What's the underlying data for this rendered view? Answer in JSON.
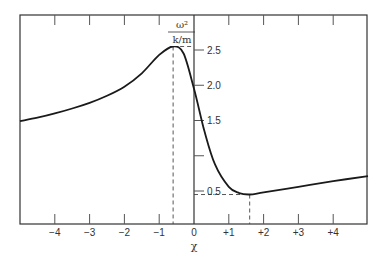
{
  "chart_data": {
    "type": "line",
    "title": "",
    "xlabel": "χ",
    "ylabel": "ω² / (k/m)",
    "ylabel_numerator": "ω²",
    "ylabel_denominator": "k/m",
    "xlim": [
      -5,
      5
    ],
    "ylim": [
      0.25,
      3.0
    ],
    "x_ticks": [
      -4,
      -3,
      -2,
      -1,
      0,
      1,
      2,
      3,
      4
    ],
    "x_tick_labels": [
      "−4",
      "−3",
      "−2",
      "−1",
      "0",
      "+1",
      "+2",
      "+3",
      "+4"
    ],
    "y_ticks": [
      0.5,
      1.0,
      1.5,
      2.0,
      2.5
    ],
    "y_tick_labels": [
      "0.5",
      "",
      "1.5",
      "2.0",
      "2.5"
    ],
    "grid": false,
    "legend": null,
    "series": [
      {
        "name": "ω²/(k/m) vs χ",
        "x": [
          -5.0,
          -4.5,
          -4.0,
          -3.5,
          -3.0,
          -2.5,
          -2.0,
          -1.5,
          -1.0,
          -0.6,
          -0.3,
          0.0,
          0.3,
          0.6,
          1.0,
          1.3,
          1.6,
          2.0,
          3.0,
          4.0,
          5.0
        ],
        "y": [
          1.49,
          1.54,
          1.6,
          1.67,
          1.75,
          1.85,
          1.98,
          2.17,
          2.43,
          2.55,
          2.45,
          1.95,
          1.35,
          0.88,
          0.56,
          0.47,
          0.45,
          0.48,
          0.56,
          0.64,
          0.71
        ]
      }
    ],
    "annotations": [
      {
        "type": "dashed-guide",
        "description": "peak",
        "x": -0.6,
        "y": 2.55
      },
      {
        "type": "dashed-guide",
        "description": "minimum",
        "x": 1.6,
        "y": 0.45
      }
    ]
  }
}
